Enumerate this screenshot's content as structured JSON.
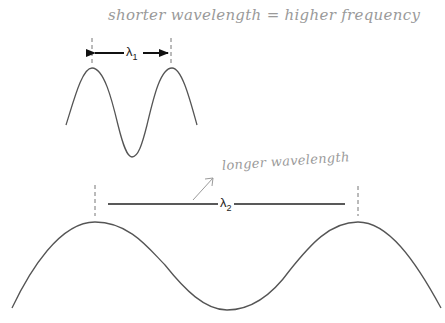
{
  "annotations": {
    "top_note": "shorter wavelength  =  higher frequency",
    "bottom_note": "longer wavelength"
  },
  "labels": {
    "lambda1": {
      "symbol": "λ",
      "subscript": "1"
    },
    "lambda2": {
      "symbol": "λ",
      "subscript": "2"
    }
  },
  "colors": {
    "wave_stroke": "#555555",
    "measure_line": "#222222",
    "dashed_guide": "#777777",
    "handwriting": "#9a9a9a"
  },
  "waves": [
    {
      "name": "short-wave",
      "peaks_x": [
        92,
        172
      ],
      "peak_y": 68,
      "trough": [
        132,
        157
      ],
      "ends": [
        [
          66,
          125
        ],
        [
          197,
          125
        ]
      ]
    },
    {
      "name": "long-wave",
      "peaks_x": [
        95,
        358
      ],
      "peak_y": 222,
      "trough": [
        227,
        310
      ],
      "ends": [
        [
          12,
          308
        ],
        [
          441,
          308
        ]
      ]
    }
  ]
}
